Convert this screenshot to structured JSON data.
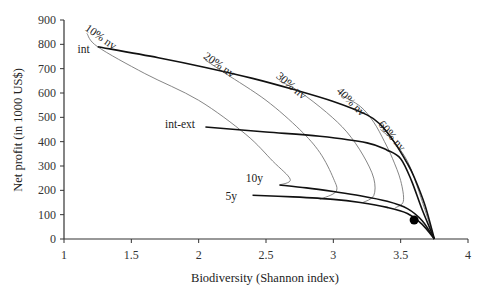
{
  "chart_data": {
    "type": "line",
    "title": "",
    "xlabel": "Biodiversity (Shannon index)",
    "ylabel": "Net profit (in 1000 US$)",
    "xlim": [
      1,
      4
    ],
    "ylim": [
      0,
      900
    ],
    "xticks": [
      "1",
      "1.5",
      "2",
      "2.5",
      "3",
      "3.5",
      "4"
    ],
    "yticks": [
      "0",
      "100",
      "200",
      "300",
      "400",
      "500",
      "600",
      "700",
      "800",
      "900"
    ],
    "grid": false,
    "series": [
      {
        "name": "int",
        "style": "thick",
        "points": [
          [
            1.25,
            790
          ],
          [
            1.7,
            745
          ],
          [
            2.05,
            705
          ],
          [
            2.4,
            660
          ],
          [
            2.7,
            615
          ],
          [
            3.0,
            565
          ],
          [
            3.25,
            510
          ],
          [
            3.35,
            470
          ],
          [
            3.45,
            400
          ],
          [
            3.55,
            310
          ],
          [
            3.6,
            255
          ],
          [
            3.68,
            140
          ],
          [
            3.75,
            0
          ]
        ]
      },
      {
        "name": "int-ext",
        "style": "thick",
        "points": [
          [
            2.05,
            460
          ],
          [
            2.5,
            440
          ],
          [
            2.9,
            422
          ],
          [
            3.25,
            395
          ],
          [
            3.4,
            365
          ],
          [
            3.5,
            330
          ],
          [
            3.58,
            240
          ],
          [
            3.66,
            120
          ],
          [
            3.75,
            0
          ]
        ]
      },
      {
        "name": "10y",
        "style": "thick",
        "points": [
          [
            2.6,
            222
          ],
          [
            2.8,
            210
          ],
          [
            3.0,
            195
          ],
          [
            3.2,
            178
          ],
          [
            3.4,
            155
          ],
          [
            3.55,
            125
          ],
          [
            3.66,
            75
          ],
          [
            3.75,
            0
          ]
        ]
      },
      {
        "name": "5y",
        "style": "thick",
        "points": [
          [
            2.4,
            180
          ],
          [
            2.7,
            173
          ],
          [
            3.0,
            163
          ],
          [
            3.2,
            150
          ],
          [
            3.4,
            130
          ],
          [
            3.55,
            105
          ],
          [
            3.66,
            60
          ],
          [
            3.75,
            0
          ]
        ]
      },
      {
        "name": "10% nv",
        "style": "thin",
        "points": [
          [
            1.17,
            845
          ],
          [
            1.25,
            790
          ],
          [
            1.6,
            680
          ],
          [
            2.0,
            570
          ],
          [
            2.35,
            430
          ],
          [
            2.55,
            320
          ],
          [
            2.68,
            245
          ],
          [
            2.6,
            222
          ]
        ]
      },
      {
        "name": "20% nv",
        "style": "thin",
        "points": [
          [
            2.05,
            735
          ],
          [
            2.2,
            680
          ],
          [
            2.5,
            570
          ],
          [
            2.75,
            450
          ],
          [
            2.9,
            355
          ],
          [
            3.0,
            250
          ],
          [
            3.02,
            195
          ],
          [
            2.9,
            163
          ]
        ]
      },
      {
        "name": "30% nv",
        "style": "thin",
        "points": [
          [
            2.6,
            650
          ],
          [
            2.75,
            605
          ],
          [
            2.95,
            520
          ],
          [
            3.1,
            440
          ],
          [
            3.22,
            345
          ],
          [
            3.3,
            250
          ],
          [
            3.3,
            178
          ],
          [
            3.22,
            150
          ]
        ]
      },
      {
        "name": "40% nv",
        "style": "thin",
        "points": [
          [
            3.06,
            590
          ],
          [
            3.2,
            545
          ],
          [
            3.3,
            480
          ],
          [
            3.38,
            400
          ],
          [
            3.44,
            330
          ],
          [
            3.5,
            240
          ],
          [
            3.52,
            155
          ],
          [
            3.46,
            128
          ]
        ]
      },
      {
        "name": "60% nv",
        "style": "thin",
        "points": [
          [
            3.35,
            450
          ],
          [
            3.45,
            400
          ],
          [
            3.55,
            320
          ],
          [
            3.62,
            220
          ],
          [
            3.68,
            120
          ],
          [
            3.75,
            0
          ]
        ]
      }
    ],
    "marker": {
      "label": "optimum",
      "x": 3.6,
      "y": 78
    },
    "annotations": [
      {
        "text": "10% nv",
        "x": 1.15,
        "y": 860,
        "rotate": 35
      },
      {
        "text": "20% nv",
        "x": 2.03,
        "y": 745,
        "rotate": 35
      },
      {
        "text": "30% nv",
        "x": 2.57,
        "y": 665,
        "rotate": 40
      },
      {
        "text": "40% nv",
        "x": 3.02,
        "y": 605,
        "rotate": 45
      },
      {
        "text": "60% nv",
        "x": 3.33,
        "y": 470,
        "rotate": 50
      },
      {
        "text": "int",
        "x": 1.1,
        "y": 765
      },
      {
        "text": "int-ext",
        "x": 1.75,
        "y": 455
      },
      {
        "text": "10y",
        "x": 2.35,
        "y": 235
      },
      {
        "text": "5y",
        "x": 2.2,
        "y": 160
      }
    ]
  }
}
